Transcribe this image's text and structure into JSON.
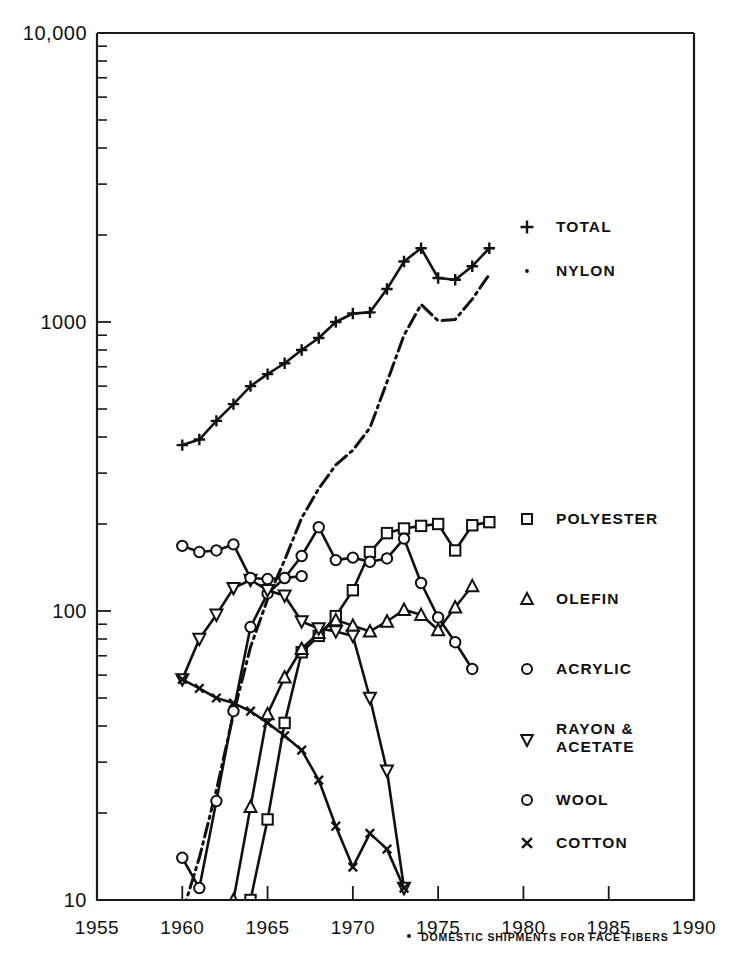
{
  "chart_data": {
    "type": "line",
    "title": "",
    "xlabel": "",
    "ylabel": "",
    "scale": "log",
    "xlim": [
      1955,
      1990
    ],
    "ylim": [
      10,
      10000
    ],
    "grid": false,
    "legend_position": "right",
    "x_ticks": [
      "1955",
      "1960",
      "1965",
      "1970",
      "1975",
      "1980",
      "1985",
      "1990"
    ],
    "y_ticks": [
      "10",
      "100",
      "1000",
      "10,000"
    ],
    "footnote": "DOMESTIC SHIPMENTS FOR FACE FIBERS",
    "footnote_marker": "•",
    "series": [
      {
        "name": "TOTAL",
        "marker": "plus",
        "style": "solid",
        "x": [
          1960,
          1961,
          1962,
          1963,
          1964,
          1965,
          1966,
          1967,
          1968,
          1969,
          1970,
          1971,
          1972,
          1973,
          1974,
          1975,
          1976,
          1977,
          1978
        ],
        "values": [
          375,
          392,
          455,
          520,
          600,
          660,
          720,
          800,
          880,
          1000,
          1070,
          1080,
          1300,
          1620,
          1800,
          1420,
          1400,
          1560,
          1800
        ]
      },
      {
        "name": "NYLON",
        "marker": "dot",
        "style": "dashdot",
        "x": [
          1960,
          1961,
          1962,
          1963,
          1964,
          1965,
          1966,
          1967,
          1968,
          1969,
          1970,
          1971,
          1972,
          1973,
          1974,
          1975,
          1976,
          1977,
          1978
        ],
        "values": [
          9,
          14,
          24,
          44,
          75,
          110,
          150,
          210,
          265,
          320,
          360,
          430,
          620,
          900,
          1150,
          1010,
          1020,
          1200,
          1460
        ]
      },
      {
        "name": "POLYESTER",
        "marker": "square",
        "style": "solid",
        "x": [
          1964,
          1965,
          1966,
          1967,
          1968,
          1969,
          1970,
          1971,
          1972,
          1973,
          1974,
          1975,
          1976,
          1977,
          1978
        ],
        "values": [
          10,
          19,
          41,
          72,
          82,
          96,
          118,
          160,
          186,
          193,
          197,
          200,
          162,
          198,
          203
        ]
      },
      {
        "name": "OLEFIN",
        "marker": "triangle-up",
        "style": "solid",
        "x": [
          1963,
          1964,
          1965,
          1966,
          1967,
          1968,
          1969,
          1970,
          1971,
          1972,
          1973,
          1974,
          1975,
          1976,
          1977
        ],
        "values": [
          10,
          21,
          44,
          59,
          74,
          84,
          93,
          89,
          85,
          92,
          101,
          97,
          86,
          103,
          122
        ]
      },
      {
        "name": "ACRYLIC",
        "marker": "circle",
        "style": "solid",
        "x": [
          1960,
          1961,
          1962,
          1963,
          1964,
          1965,
          1966,
          1967,
          1968,
          1969,
          1970,
          1971,
          1972,
          1973,
          1974,
          1975,
          1976,
          1977
        ],
        "values": [
          14,
          11,
          22,
          45,
          88,
          115,
          130,
          155,
          195,
          150,
          153,
          148,
          152,
          178,
          125,
          95,
          78,
          63
        ]
      },
      {
        "name": "RAYON & ACETATE",
        "marker": "triangle-down",
        "style": "solid",
        "x": [
          1960,
          1961,
          1962,
          1963,
          1964,
          1965,
          1966,
          1967,
          1968,
          1969,
          1970,
          1971,
          1972,
          1973
        ],
        "values": [
          58,
          80,
          97,
          120,
          128,
          118,
          113,
          92,
          87,
          85,
          82,
          50,
          28,
          11
        ]
      },
      {
        "name": "WOOL",
        "marker": "circle",
        "style": "solid",
        "x": [
          1960,
          1961,
          1962,
          1963,
          1964,
          1965,
          1966,
          1967
        ],
        "values": [
          168,
          160,
          162,
          170,
          130,
          129,
          130,
          132
        ]
      },
      {
        "name": "COTTON",
        "marker": "x",
        "style": "solid",
        "x": [
          1960,
          1961,
          1962,
          1963,
          1964,
          1965,
          1966,
          1967,
          1968,
          1969,
          1970,
          1971,
          1972,
          1973
        ],
        "values": [
          58,
          54,
          50,
          48,
          45,
          41,
          37,
          33,
          26,
          18,
          13,
          17,
          15,
          11
        ]
      }
    ]
  },
  "legend": {
    "items": [
      {
        "label": "TOTAL",
        "marker": "plus"
      },
      {
        "label": "NYLON",
        "marker": "dot"
      },
      {
        "label": "POLYESTER",
        "marker": "square"
      },
      {
        "label": "OLEFIN",
        "marker": "triangle-up"
      },
      {
        "label": "ACRYLIC",
        "marker": "circle"
      },
      {
        "label": "RAYON &",
        "label2": "ACETATE",
        "marker": "triangle-down"
      },
      {
        "label": "WOOL",
        "marker": "circle"
      },
      {
        "label": "COTTON",
        "marker": "x"
      }
    ]
  },
  "colors": {
    "ink": "#111111",
    "background": "#ffffff"
  }
}
